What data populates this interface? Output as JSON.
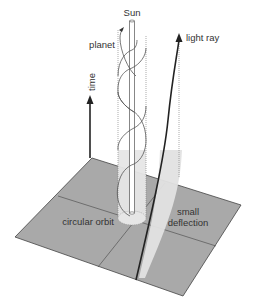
{
  "diagram": {
    "labels": {
      "sun": "Sun",
      "planet": "planet",
      "light_ray": "light ray",
      "time": "time",
      "circular_orbit": "circular orbit",
      "small_deflection_line1": "small",
      "small_deflection_line2": "deflection"
    },
    "colors": {
      "plane_fill": "#a8a8a8",
      "plane_edge": "#444444",
      "tube_fill": "#e6e6e6",
      "line": "#333333",
      "dotted": "#888888"
    }
  }
}
